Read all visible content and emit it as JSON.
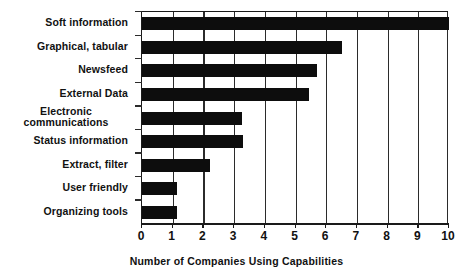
{
  "chart_data": {
    "type": "bar",
    "orientation": "horizontal",
    "title": "",
    "xlabel": "Number of Companies Using Capabilities",
    "ylabel": "",
    "categories": [
      "Soft information",
      "Graphical, tabular",
      "Newsfeed",
      "External Data",
      "Electronic communications",
      "Status information",
      "Extract, filter",
      "User friendly",
      "Organizing tools"
    ],
    "values": [
      10,
      6.5,
      5.7,
      5.45,
      3.25,
      3.3,
      2.2,
      1.15,
      1.15
    ],
    "xlim": [
      0,
      10
    ],
    "xticks": [
      0,
      1,
      2,
      3,
      4,
      5,
      6,
      7,
      8,
      9,
      10
    ],
    "xtick_labels": [
      "0",
      "1",
      "2",
      "3",
      "4",
      "5",
      "6",
      "7",
      "8",
      "9",
      "10"
    ],
    "grid": "vertical",
    "legend": "none",
    "bar_color": "#0d0d0d",
    "axis_color": "#1a1a1a",
    "background_color": "#ffffff"
  },
  "category_labels": [
    {
      "line1": "Soft information",
      "line2": ""
    },
    {
      "line1": "Graphical, tabular",
      "line2": ""
    },
    {
      "line1": "Newsfeed",
      "line2": ""
    },
    {
      "line1": "External Data",
      "line2": ""
    },
    {
      "line1": "Electronic",
      "line2": "communications"
    },
    {
      "line1": "Status information",
      "line2": ""
    },
    {
      "line1": "Extract, filter",
      "line2": ""
    },
    {
      "line1": "User friendly",
      "line2": ""
    },
    {
      "line1": "Organizing tools",
      "line2": ""
    }
  ]
}
